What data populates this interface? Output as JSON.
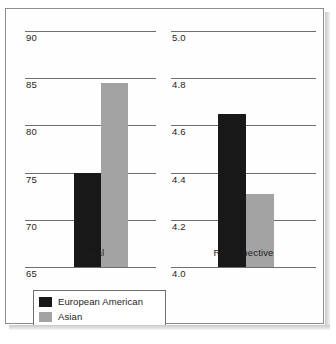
{
  "chart_data": {
    "type": "bar",
    "title": "",
    "xlabel": "",
    "ylabel": "",
    "grid": true,
    "legend_position": "bottom-left",
    "series": [
      {
        "name": "European American",
        "color": "#181818",
        "values": [
          75.0,
          4.65
        ]
      },
      {
        "name": "Asian",
        "color": "#a3a3a3",
        "values": [
          84.5,
          4.31
        ]
      }
    ],
    "panels": [
      {
        "category": "Actual",
        "ylim": [
          65,
          90
        ],
        "yticks": [
          "65",
          "70",
          "75",
          "80",
          "85",
          "90"
        ],
        "ytick_values": [
          65,
          70,
          75,
          80,
          85,
          90
        ],
        "bars": [
          {
            "series": "European American",
            "value": 75.0
          },
          {
            "series": "Asian",
            "value": 84.5
          }
        ]
      },
      {
        "category": "Retrospective",
        "ylim": [
          4.0,
          5.0
        ],
        "yticks": [
          "4.0",
          "4.2",
          "4.4",
          "4.6",
          "4.8",
          "5.0"
        ],
        "ytick_values": [
          4.0,
          4.2,
          4.4,
          4.6,
          4.8,
          5.0
        ],
        "bars": [
          {
            "series": "European American",
            "value": 4.65
          },
          {
            "series": "Asian",
            "value": 4.31
          }
        ]
      }
    ]
  },
  "legend": {
    "items": [
      {
        "label": "European American",
        "color": "#181818"
      },
      {
        "label": "Asian",
        "color": "#a3a3a3"
      }
    ]
  }
}
